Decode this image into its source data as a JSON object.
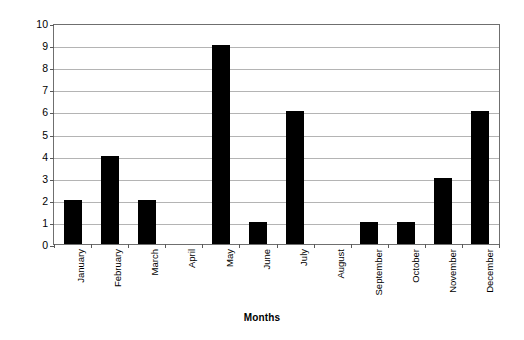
{
  "chart_data": {
    "type": "bar",
    "title": "",
    "subtitle": "",
    "xlabel": "Months",
    "ylabel": "Number of visual representations",
    "categories": [
      "January",
      "February",
      "March",
      "April",
      "May",
      "June",
      "July",
      "August",
      "September",
      "October",
      "November",
      "December"
    ],
    "values": [
      2,
      4,
      2,
      0,
      9,
      1,
      6,
      0,
      1,
      1,
      3,
      6
    ],
    "series": [
      {
        "name": "Number of visual representations",
        "values": [
          2,
          4,
          2,
          0,
          9,
          1,
          6,
          0,
          1,
          1,
          3,
          6
        ]
      }
    ],
    "ylim": [
      0,
      10
    ],
    "ytick_labels": [
      "10",
      "9",
      "8",
      "7",
      "6",
      "5",
      "4",
      "3",
      "2",
      "1",
      "0"
    ],
    "ytick_values": [
      10,
      9,
      8,
      7,
      6,
      5,
      4,
      3,
      2,
      1,
      0
    ],
    "ytick_step": 1,
    "grid": true,
    "grid_axis": "y",
    "legend": false,
    "legend_position": "none",
    "bar_color": "#000000",
    "grid_color": "#b4b4b4",
    "axis_color": "#6f6f6f",
    "background_color": "#ffffff",
    "xtick_label_rotation": 90,
    "annotations": []
  }
}
